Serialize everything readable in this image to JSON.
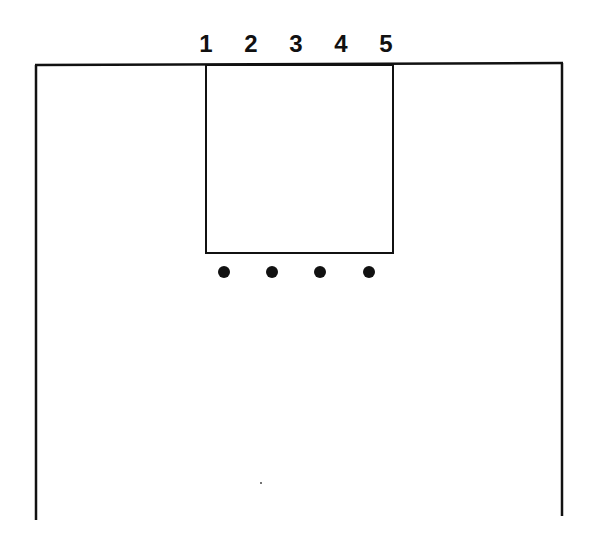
{
  "diagram": {
    "type": "court-lane",
    "labels": [
      "1",
      "2",
      "3",
      "4",
      "5"
    ],
    "label_x": [
      206,
      251,
      296,
      341,
      386
    ],
    "label_y": 52,
    "court": {
      "left_x": 36,
      "right_x": 562,
      "top_y": 65,
      "bottom_y": 520
    },
    "lane": {
      "x": 206,
      "y": 65,
      "width": 187,
      "height": 188
    },
    "dots": [
      {
        "x": 224,
        "y": 272
      },
      {
        "x": 272,
        "y": 272
      },
      {
        "x": 320,
        "y": 272
      },
      {
        "x": 369,
        "y": 272
      }
    ],
    "stray_mark": {
      "x": 261,
      "y": 483
    },
    "line_color": "#111111"
  }
}
